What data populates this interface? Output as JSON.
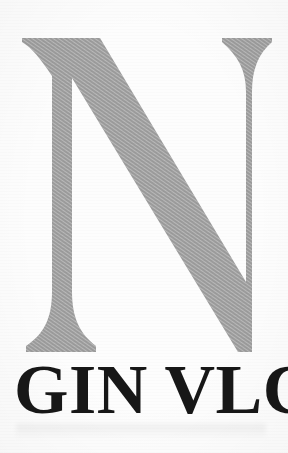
{
  "image": {
    "kind": "scanned-logo",
    "background_color": "#fdfdfd",
    "width": 288,
    "height": 453
  },
  "logo": {
    "monogram": {
      "letter": "N",
      "icon_name": "letter-n-monogram",
      "color": "#9b9b9b",
      "style": "serif-capital"
    },
    "wordmark": {
      "text": "GIN VLC",
      "color": "#171717",
      "style": "bold-serif",
      "note": "right edge of final C is cropped by the image boundary"
    }
  },
  "accessibility": {
    "alt": "Logo: large gray serif capital letter N above bold black serif text GIN VLC"
  }
}
